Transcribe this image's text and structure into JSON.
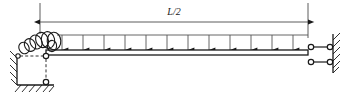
{
  "figure": {
    "kind": "structural-beam-diagram",
    "title_visible": false,
    "background_color": "#ffffff",
    "line_color": "#1a1a1a",
    "canvas": {
      "width": 350,
      "height": 96
    }
  },
  "dimension": {
    "label": "L/2",
    "label_x": 174,
    "label_y": 14,
    "line_y": 22,
    "start_x": 40,
    "end_x": 308,
    "arrow_style": "filled-triangle-both-ends",
    "extension_lines": [
      {
        "x": 40,
        "y_top": 3,
        "y_bottom": 34
      },
      {
        "x": 308,
        "y_top": 3,
        "y_bottom": 38
      }
    ]
  },
  "beam": {
    "x_left": 46,
    "x_right": 308,
    "y_top": 50,
    "y_bottom": 55,
    "thickness": 5,
    "fill": "#ffffff"
  },
  "distributed_load": {
    "name": "uniformly-distributed-load",
    "top_line_y": 35,
    "arrow_tip_y": 50,
    "x_start": 57,
    "x_end": 308,
    "arrow_count": 12,
    "arrow_x_positions": [
      62,
      83,
      104,
      125,
      146,
      167,
      188,
      209,
      230,
      251,
      272,
      293
    ]
  },
  "left_support": {
    "name": "left-pin-link-support",
    "wall": {
      "x": 17,
      "y_top": 54,
      "y_bottom": 84,
      "hatch_count": 4,
      "hatch_side": "left"
    },
    "ground": {
      "y": 84,
      "x_start": 17,
      "x_end": 54,
      "hatch_count": 6,
      "hatch_side": "below"
    },
    "pins": [
      {
        "name": "wall-pin",
        "cx": 18,
        "cy": 56,
        "r": 2.2
      },
      {
        "name": "beam-pin",
        "cx": 46,
        "cy": 56,
        "r": 2.6
      },
      {
        "name": "ground-pin",
        "cx": 46,
        "cy": 82,
        "r": 2.6
      }
    ],
    "links": [
      {
        "name": "horizontal-link",
        "type": "dashed",
        "x1": 20,
        "y1": 56,
        "x2": 44,
        "y2": 56
      },
      {
        "name": "vertical-link",
        "type": "dashed",
        "x1": 46,
        "y1": 58,
        "x2": 46,
        "y2": 80
      }
    ]
  },
  "spring": {
    "name": "coil-spring",
    "description": "helical coil spring at left end of beam",
    "coil_count": 7,
    "center_y": 43,
    "x_start": 20,
    "x_end": 58,
    "ellipse_rx": 6.5,
    "ellipse_ry": 8.5
  },
  "right_support": {
    "name": "right-double-link-support",
    "wall": {
      "x": 333,
      "y_top": 34,
      "y_bottom": 72,
      "hatch_count": 6,
      "hatch_side": "right"
    },
    "links": [
      {
        "name": "upper-link",
        "x1": 311,
        "y1": 47,
        "x2": 330,
        "y2": 47
      },
      {
        "name": "lower-link",
        "x1": 311,
        "y1": 62,
        "x2": 330,
        "y2": 62
      }
    ],
    "pins": [
      {
        "name": "upper-beam-pin",
        "cx": 311,
        "cy": 47,
        "r": 2.6
      },
      {
        "name": "upper-wall-pin",
        "cx": 330,
        "cy": 47,
        "r": 2.6
      },
      {
        "name": "lower-beam-pin",
        "cx": 311,
        "cy": 62,
        "r": 2.6
      },
      {
        "name": "lower-wall-pin",
        "cx": 330,
        "cy": 62,
        "r": 2.6
      }
    ]
  }
}
